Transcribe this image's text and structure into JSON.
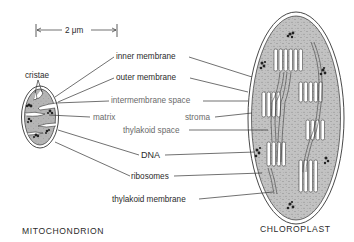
{
  "figure": {
    "type": "labeled comparative biology diagram",
    "scale_bar": {
      "label": "2 μm"
    },
    "organelles": [
      {
        "name": "MITOCHONDRION"
      },
      {
        "name": "CHLOROPLAST"
      }
    ],
    "labels": {
      "cristae": "cristae",
      "inner_membrane": "inner membrane",
      "outer_membrane": "outer membrane",
      "intermembrane_space": "intermembrane space",
      "matrix": "matrix",
      "stroma": "stroma",
      "thylakoid_space": "thylakoid space",
      "dna": "DNA",
      "ribosomes": "ribosomes",
      "thylakoid_membrane": "thylakoid membrane"
    },
    "colors": {
      "outline": "#333333",
      "stroma_fill": "#bdbdbd",
      "matrix_fill": "#b9b9b9",
      "stipple": "#6e6e6e",
      "thylakoid_fill": "#ffffff",
      "label_text": "#2b2b2b",
      "label_text_light": "#6a6a6a"
    }
  }
}
